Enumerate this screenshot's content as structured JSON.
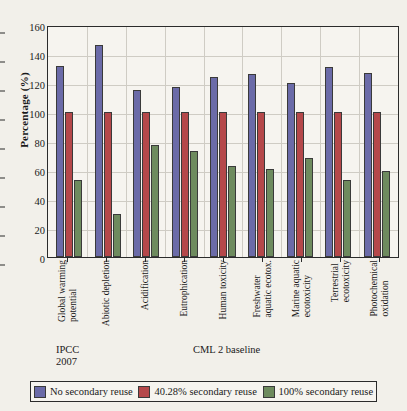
{
  "chart_data": {
    "type": "bar",
    "title": "",
    "xlabel": "",
    "ylabel": "Percentage (%)",
    "ylim": [
      0,
      160
    ],
    "ytick_step": 20,
    "yticks": [
      0,
      20,
      40,
      60,
      80,
      100,
      120,
      140,
      160
    ],
    "grid": true,
    "legend_position": "bottom",
    "categories": [
      "Global warming potential",
      "Abiotic depletion",
      "Acidification",
      "Eutrophication",
      "Human toxicity",
      "Freshwater aquatic ecotox.",
      "Marine aquatic ecotoxicity",
      "Terrestrial ecotoxicity",
      "Photochemical oxidation"
    ],
    "category_lines": [
      [
        "Global warming",
        "potential"
      ],
      [
        "Abiotic depletion"
      ],
      [
        "Acidification"
      ],
      [
        "Eutrophication"
      ],
      [
        "Human toxicity"
      ],
      [
        "Freshwater",
        "aquatic ecotox."
      ],
      [
        "Marine aquatic",
        "ecotoxicity"
      ],
      [
        "Terrestrial",
        "ecotoxicity"
      ],
      [
        "Photochemical",
        "oxidation"
      ]
    ],
    "series": [
      {
        "name": "No secondary reuse",
        "color": "#6b6ba8",
        "values": [
          132,
          146,
          115,
          117,
          124,
          126,
          120,
          131,
          127
        ]
      },
      {
        "name": "40.28% secondary reuse",
        "color": "#b5484a",
        "values": [
          100,
          100,
          100,
          100,
          100,
          100,
          100,
          100,
          100
        ]
      },
      {
        "name": "100% secondary reuse",
        "color": "#6e8b5e",
        "values": [
          53,
          30,
          77,
          73,
          63,
          61,
          68,
          53,
          59
        ]
      }
    ],
    "annotations": [
      {
        "name": "ipcc",
        "lines": [
          "IPCC",
          "2007"
        ]
      },
      {
        "name": "cml",
        "lines": [
          "CML 2 baseline"
        ]
      }
    ]
  },
  "legend": {
    "entries": [
      {
        "label": "No secondary reuse"
      },
      {
        "label": "40.28% secondary reuse"
      },
      {
        "label": "100% secondary reuse"
      }
    ]
  }
}
